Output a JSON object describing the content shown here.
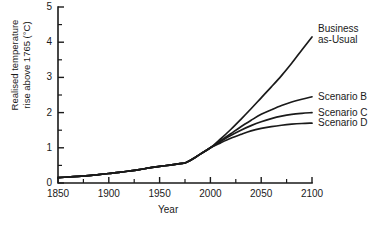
{
  "chart_data": {
    "type": "line",
    "title": "",
    "xlabel": "Year",
    "ylabel": "Realised temperature rise above 1765 (°C)",
    "ylabel_line1": "Realised temperature",
    "ylabel_line2": "rise above 1765 (°C)",
    "xlim": [
      1850,
      2100
    ],
    "ylim": [
      0,
      5
    ],
    "xticks": [
      1850,
      1900,
      1950,
      2000,
      2050,
      2100
    ],
    "xtick_labels": [
      "1850",
      "1900",
      "1950",
      "2000",
      "2050",
      "2100"
    ],
    "xminor_step": 25,
    "yticks": [
      0,
      1,
      2,
      3,
      4,
      5
    ],
    "ytick_labels": [
      "0",
      "1",
      "2",
      "3",
      "4",
      "5"
    ],
    "yminor_step": 0.5,
    "grid": false,
    "legend_position": "right-inline",
    "line_color": "#1a1a1a",
    "x": [
      1850,
      1860,
      1870,
      1880,
      1890,
      1900,
      1910,
      1920,
      1930,
      1940,
      1950,
      1960,
      1970,
      1975,
      1980,
      1990,
      2000,
      2010,
      2020,
      2030,
      2040,
      2050,
      2060,
      2070,
      2080,
      2090,
      2100
    ],
    "series": [
      {
        "name": "Business as-Usual",
        "label_line1": "Business",
        "label_line2": "as-Usual",
        "values": [
          0.15,
          0.17,
          0.19,
          0.21,
          0.24,
          0.27,
          0.3,
          0.34,
          0.38,
          0.43,
          0.47,
          0.51,
          0.55,
          0.57,
          0.64,
          0.82,
          1.0,
          1.25,
          1.52,
          1.81,
          2.11,
          2.42,
          2.73,
          3.05,
          3.4,
          3.78,
          4.15
        ],
        "value_2100": 4.15
      },
      {
        "name": "Scenario B",
        "label_line1": "Scenario B",
        "label_line2": "",
        "values": [
          0.15,
          0.17,
          0.19,
          0.21,
          0.24,
          0.27,
          0.3,
          0.34,
          0.38,
          0.43,
          0.47,
          0.51,
          0.55,
          0.57,
          0.64,
          0.82,
          1.0,
          1.2,
          1.4,
          1.6,
          1.78,
          1.95,
          2.08,
          2.2,
          2.3,
          2.38,
          2.45
        ],
        "value_2100": 2.45
      },
      {
        "name": "Scenario C",
        "label_line1": "Scenario C",
        "label_line2": "",
        "values": [
          0.15,
          0.17,
          0.19,
          0.21,
          0.24,
          0.27,
          0.3,
          0.34,
          0.38,
          0.43,
          0.47,
          0.51,
          0.55,
          0.57,
          0.64,
          0.82,
          1.0,
          1.18,
          1.35,
          1.5,
          1.63,
          1.74,
          1.83,
          1.9,
          1.95,
          1.98,
          2.0
        ],
        "value_2100": 2.0
      },
      {
        "name": "Scenario D",
        "label_line1": "Scenario D",
        "label_line2": "",
        "values": [
          0.15,
          0.17,
          0.19,
          0.21,
          0.24,
          0.27,
          0.3,
          0.34,
          0.38,
          0.43,
          0.47,
          0.51,
          0.55,
          0.57,
          0.64,
          0.82,
          1.0,
          1.14,
          1.27,
          1.38,
          1.48,
          1.55,
          1.6,
          1.64,
          1.67,
          1.69,
          1.7
        ],
        "value_2100": 1.7
      }
    ]
  }
}
